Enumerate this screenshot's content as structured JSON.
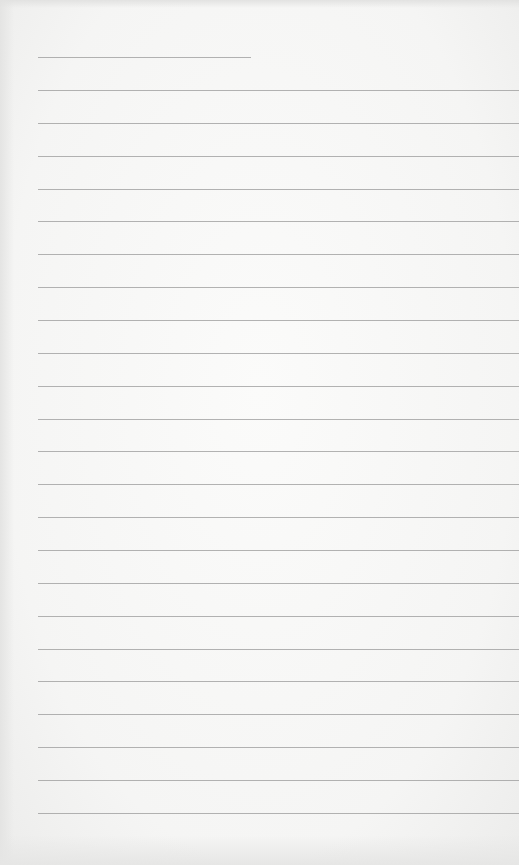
{
  "image": {
    "subject": "blank lined notebook paper",
    "paper_color": "#f7f7f6",
    "line_color": "#9a9a9a"
  },
  "short_line": {
    "x": 38,
    "y": 57,
    "width": 213
  },
  "ruled_lines": {
    "start_y": 90,
    "spacing": 32.86,
    "count": 23,
    "x": 38,
    "width": 481
  }
}
